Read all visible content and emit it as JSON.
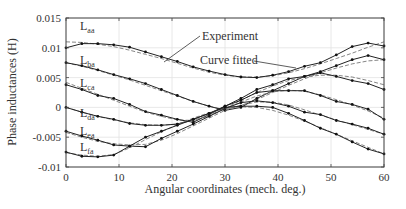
{
  "chart_data": {
    "type": "line",
    "title": "",
    "xlabel": "Angular coordinates (mech. deg.)",
    "ylabel": "Phase inductances (H)",
    "xlim": [
      0,
      60
    ],
    "ylim": [
      -0.01,
      0.015
    ],
    "x_ticks": [
      "0",
      "10",
      "20",
      "30",
      "40",
      "50",
      "60"
    ],
    "y_ticks": [
      "0.015",
      "0.01",
      "0.005",
      "0",
      "-0.005",
      "-0.01"
    ],
    "grid": true,
    "x": [
      0,
      3,
      6,
      9,
      12,
      15,
      18,
      21,
      24,
      27,
      30,
      33,
      36,
      39,
      42,
      45,
      48,
      51,
      54,
      57,
      60
    ],
    "series": [
      {
        "name": "L_aa",
        "label_main": "L",
        "label_sub": "aa",
        "experiment": [
          0.01,
          0.0107,
          0.0107,
          0.0105,
          0.0101,
          0.0093,
          0.0085,
          0.0077,
          0.0068,
          0.0061,
          0.0055,
          0.0051,
          0.005,
          0.0054,
          0.006,
          0.0069,
          0.0075,
          0.0088,
          0.0102,
          0.0108,
          0.0103
        ],
        "fitted": [
          0.011,
          0.0109,
          0.0106,
          0.0102,
          0.0096,
          0.0089,
          0.0082,
          0.0074,
          0.0066,
          0.0059,
          0.0054,
          0.0051,
          0.0051,
          0.0053,
          0.0058,
          0.0065,
          0.0073,
          0.0082,
          0.0091,
          0.0101,
          0.011
        ]
      },
      {
        "name": "L_ba",
        "label_main": "L",
        "label_sub": "ba",
        "experiment": [
          0.0075,
          0.007,
          0.0063,
          0.0055,
          0.0048,
          0.004,
          0.003,
          0.002,
          0.001,
          0.0002,
          -0.0005,
          0.0,
          0.0015,
          0.0028,
          0.004,
          0.0052,
          0.006,
          0.007,
          0.008,
          0.0087,
          0.008
        ],
        "fitted": [
          0.0075,
          0.0069,
          0.0062,
          0.0054,
          0.0046,
          0.0037,
          0.0028,
          0.0019,
          0.001,
          0.0002,
          -0.0004,
          0.0003,
          0.0013,
          0.0025,
          0.0037,
          0.0048,
          0.0058,
          0.0066,
          0.0073,
          0.0078,
          0.008
        ]
      },
      {
        "name": "L_ca",
        "label_main": "L",
        "label_sub": "ca",
        "experiment": [
          0.0038,
          0.003,
          0.002,
          0.0015,
          0.0005,
          -0.0007,
          -0.0013,
          -0.002,
          -0.0025,
          -0.0012,
          0.0002,
          0.0015,
          0.003,
          0.0038,
          0.0048,
          0.0052,
          0.0058,
          0.0052,
          0.0045,
          0.004,
          0.003
        ],
        "fitted": [
          0.0042,
          0.0032,
          0.0022,
          0.0012,
          0.0002,
          -0.0008,
          -0.0015,
          -0.0021,
          -0.0022,
          -0.0015,
          -0.0002,
          0.0012,
          0.0025,
          0.0036,
          0.0045,
          0.0051,
          0.0054,
          0.0054,
          0.0051,
          0.0045,
          0.0038
        ]
      },
      {
        "name": "L_da",
        "label_main": "L",
        "label_sub": "da",
        "experiment": [
          0.0,
          -0.0008,
          -0.0015,
          -0.002,
          -0.0027,
          -0.003,
          -0.003,
          -0.0028,
          -0.002,
          -0.001,
          0.0002,
          0.0012,
          0.0025,
          0.0028,
          0.0028,
          0.0028,
          0.002,
          0.001,
          0.0005,
          -0.0003,
          -0.002
        ],
        "fitted": [
          0.0,
          -0.0008,
          -0.0015,
          -0.0021,
          -0.0026,
          -0.0029,
          -0.003,
          -0.0028,
          -0.0022,
          -0.0013,
          -0.0002,
          0.0009,
          0.0019,
          0.0026,
          0.0029,
          0.0027,
          0.0021,
          0.0013,
          0.0004,
          -0.0006,
          -0.0018
        ]
      },
      {
        "name": "L_ea",
        "label_main": "L",
        "label_sub": "ea",
        "experiment": [
          -0.004,
          -0.0048,
          -0.0055,
          -0.0063,
          -0.0065,
          -0.0066,
          -0.0052,
          -0.004,
          -0.0028,
          -0.0015,
          -0.0002,
          0.0008,
          0.0011,
          0.0008,
          0.0002,
          -0.0008,
          -0.0012,
          -0.0022,
          -0.0028,
          -0.0035,
          -0.0045
        ],
        "fitted": [
          -0.0042,
          -0.005,
          -0.0057,
          -0.0061,
          -0.0063,
          -0.0062,
          -0.0055,
          -0.0044,
          -0.0031,
          -0.0018,
          -0.0005,
          0.0004,
          0.0009,
          0.0009,
          0.0004,
          -0.0004,
          -0.0013,
          -0.0021,
          -0.0029,
          -0.0037,
          -0.0045
        ]
      },
      {
        "name": "L_fa",
        "label_main": "L",
        "label_sub": "fa",
        "experiment": [
          -0.0075,
          -0.0082,
          -0.0083,
          -0.008,
          -0.0065,
          -0.005,
          -0.004,
          -0.003,
          -0.002,
          -0.001,
          0.0,
          0.0002,
          0.0002,
          0.0,
          -0.001,
          -0.0022,
          -0.0035,
          -0.0045,
          -0.0058,
          -0.007,
          -0.0078
        ],
        "fitted": [
          -0.0076,
          -0.008,
          -0.0082,
          -0.0079,
          -0.0068,
          -0.0054,
          -0.0041,
          -0.0029,
          -0.0018,
          -0.0009,
          -0.0002,
          0.0001,
          0.0,
          -0.0005,
          -0.0013,
          -0.0023,
          -0.0034,
          -0.0045,
          -0.0056,
          -0.0067,
          -0.0078
        ]
      }
    ],
    "annotations": [
      {
        "text": "Experiment",
        "target_series": "L_aa",
        "target_x": 12
      },
      {
        "text": "Curve fitted",
        "target_series": "L_aa",
        "target_x": 56
      }
    ],
    "legend": "none (inline labels)"
  },
  "labels": {
    "xlabel": "Angular coordinates (mech. deg.)",
    "ylabel": "Phase inductances (H)",
    "annotation_experiment": "Experiment",
    "annotation_fitted": "Curve fitted"
  }
}
